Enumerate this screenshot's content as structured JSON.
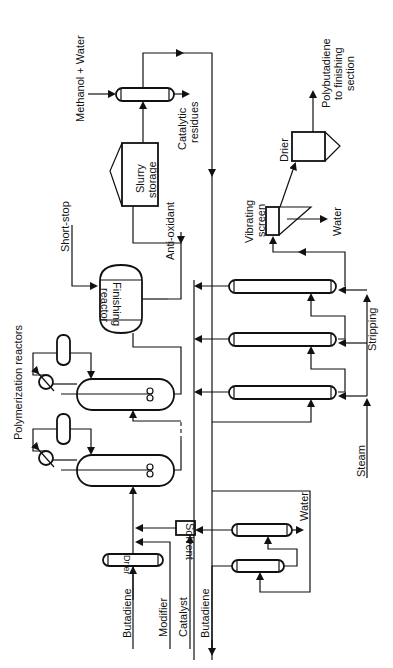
{
  "diagram": {
    "orientation": "rotated 90° counter-clockwise",
    "labels": {
      "polymerization_reactors": "Polymerization reactors",
      "short_stop": "Short-stop",
      "finishing_reactor_line1": "Finishing",
      "finishing_reactor_line2": "reactor",
      "slurry_storage_line1": "Slurry",
      "slurry_storage_line2": "storage",
      "anti_oxidant": "Anti-oxidant",
      "methanol_water": "Methanol + Water",
      "catalytic_residues_line1": "Catalytic",
      "catalytic_residues_line2": "residues",
      "product_line1": "Polybutadiene",
      "product_line2": "to finishing",
      "product_line3": "section",
      "drier_product": "Drier",
      "vibrating_screen_line1": "Vibrating",
      "vibrating_screen_line2": "screen",
      "water_screen": "Water",
      "stripping": "Stripping",
      "steam": "Steam",
      "solvent": "Solvent",
      "water_wash": "Water",
      "butadiene_in": "Butadiene",
      "modifier": "Modifier",
      "catalyst": "Catalyst",
      "butadiene_recycle": "Butadiene",
      "drier_feed": "Drier"
    },
    "equipment": [
      "Feed drier",
      "Solvent mixer",
      "Polymerization reactor 1",
      "Polymerization reactor 2",
      "Finishing reactor",
      "Slurry storage",
      "Methanol wash column",
      "Stripping column 1",
      "Stripping column 2",
      "Stripping column 3",
      "Vibrating screen",
      "Product drier",
      "Solvent recovery column 1",
      "Solvent recovery column 2"
    ]
  }
}
